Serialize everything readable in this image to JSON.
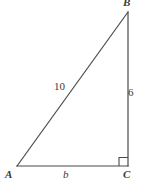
{
  "figure": {
    "background_color": "#ffffff",
    "stroke_color": "#4a4a4a",
    "text_color": "#3a3a3a",
    "vertices": {
      "A": {
        "label": "A",
        "x": 17,
        "y": 166
      },
      "B": {
        "label": "B",
        "x": 128,
        "y": 12
      },
      "C": {
        "label": "C",
        "x": 128,
        "y": 166
      }
    },
    "sides": {
      "hypotenuse": {
        "label": "10",
        "from": "A",
        "to": "B"
      },
      "vertical_leg": {
        "label": "6",
        "from": "B",
        "to": "C"
      },
      "horizontal_leg": {
        "label": "b",
        "from": "A",
        "to": "C"
      }
    },
    "right_angle": {
      "at": "C",
      "marker": "right-angle-square",
      "size": 8
    }
  }
}
